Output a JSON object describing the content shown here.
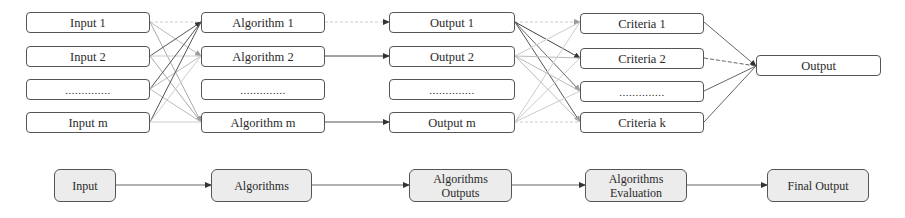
{
  "top_flow": {
    "inputs": [
      "Input 1",
      "Input 2",
      "..............",
      "Input m"
    ],
    "algorithms": [
      "Algorithm 1",
      "Algorithm 2",
      "..............",
      "Algorithm m"
    ],
    "outputs": [
      "Output 1",
      "Output 2",
      "..............",
      "Output m"
    ],
    "criteria": [
      "Criteria 1",
      "Criteria 2",
      "..............",
      "Criteria k"
    ],
    "final": "Output"
  },
  "bottom_flow": {
    "steps": [
      "Input",
      "Algorithms",
      "Algorithms Outputs",
      "Algorithms Evaluation",
      "Final Output"
    ],
    "step_lines": [
      [
        "Input"
      ],
      [
        "Algorithms"
      ],
      [
        "Algorithms",
        "Outputs"
      ],
      [
        "Algorithms",
        "Evaluation"
      ],
      [
        "Final Output"
      ]
    ]
  }
}
